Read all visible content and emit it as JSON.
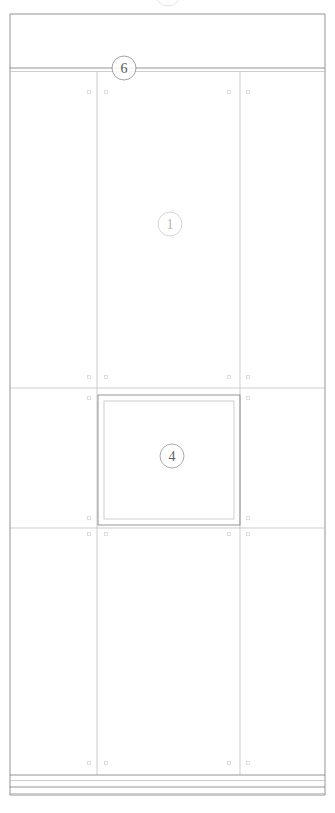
{
  "drawing": {
    "title": "Cabinet Elevation",
    "type": "architectural-elevation",
    "canvas": {
      "width": 335,
      "height": 813
    },
    "background_color": "#ffffff",
    "line_color": "#7a7a7a",
    "line_color_light": "#b9b9b9",
    "line_color_faint": "#d2d2d2"
  },
  "frame": {
    "left": 10,
    "right": 325,
    "top": 14,
    "bottom": 795
  },
  "top_band": {
    "name": "cornice-band",
    "top": 14,
    "bottom": 68,
    "divider_line_1_y": 68,
    "divider_line_2_y": 71.5
  },
  "columns": {
    "divider_left_x": 97,
    "divider_right_x": 240
  },
  "sections": {
    "upper": {
      "top": 72,
      "bottom": 388
    },
    "middle": {
      "top": 388,
      "bottom": 528
    },
    "lower": {
      "top": 528,
      "bottom": 775
    }
  },
  "section_dividers": [
    {
      "name": "divider-upper-middle",
      "y": 388
    },
    {
      "name": "divider-middle-lower",
      "y": 528
    }
  ],
  "inset_panel": {
    "name": "glazed-door-panel",
    "outer": {
      "x": 98,
      "y": 395,
      "width": 142,
      "height": 130
    },
    "inner_offset": 6
  },
  "plinth": {
    "name": "base-plinth",
    "lines_y": [
      775,
      780.5,
      787,
      793.5
    ]
  },
  "callouts": [
    {
      "id": "callout-6",
      "label": "6",
      "cx": 124,
      "cy": 68,
      "r": 12,
      "opacity": 0.85,
      "font_size": 14
    },
    {
      "id": "callout-1",
      "label": "1",
      "cx": 170,
      "cy": 224,
      "r": 12,
      "opacity": 0.38,
      "font_size": 14
    },
    {
      "id": "callout-4",
      "label": "4",
      "cx": 172,
      "cy": 456,
      "r": 12,
      "opacity": 0.8,
      "font_size": 14
    }
  ],
  "partial_callout_top": {
    "id": "callout-partial-top",
    "cx": 168,
    "cy": -6,
    "r": 12,
    "opacity": 0.3
  },
  "hardware_markers": [
    {
      "name": "marker",
      "x": 89,
      "y": 92
    },
    {
      "name": "marker",
      "x": 106,
      "y": 92
    },
    {
      "name": "marker",
      "x": 229,
      "y": 92
    },
    {
      "name": "marker",
      "x": 248,
      "y": 92
    },
    {
      "name": "marker",
      "x": 89,
      "y": 377
    },
    {
      "name": "marker",
      "x": 106,
      "y": 377
    },
    {
      "name": "marker",
      "x": 229,
      "y": 377
    },
    {
      "name": "marker",
      "x": 248,
      "y": 377
    },
    {
      "name": "marker",
      "x": 89,
      "y": 398
    },
    {
      "name": "marker",
      "x": 248,
      "y": 398
    },
    {
      "name": "marker",
      "x": 89,
      "y": 518
    },
    {
      "name": "marker",
      "x": 248,
      "y": 518
    },
    {
      "name": "marker",
      "x": 89,
      "y": 534
    },
    {
      "name": "marker",
      "x": 106,
      "y": 534
    },
    {
      "name": "marker",
      "x": 229,
      "y": 534
    },
    {
      "name": "marker",
      "x": 248,
      "y": 534
    },
    {
      "name": "marker",
      "x": 89,
      "y": 763
    },
    {
      "name": "marker",
      "x": 106,
      "y": 763
    },
    {
      "name": "marker",
      "x": 229,
      "y": 763
    },
    {
      "name": "marker",
      "x": 248,
      "y": 763
    }
  ]
}
